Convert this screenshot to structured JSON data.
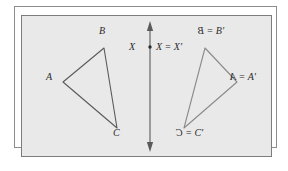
{
  "figure": {
    "background_color": "#ffffff",
    "panel_color": "#e9e9e9",
    "frame_border_color": "#8c8c8c",
    "panel_border_color": "#7d7d7d",
    "stroke_color": "#5a5a5a",
    "label_color": "#2b2b2b"
  },
  "mirror_line": {
    "name": "vertical-mirror-axis",
    "x": 150,
    "y_top": 22,
    "y_bottom": 151,
    "arrow_top": "up",
    "arrow_bottom": "down"
  },
  "center_point": {
    "label_left": "X",
    "label_right": "X = X'",
    "dot_x": 150,
    "dot_y": 47
  },
  "preimage": {
    "name": "triangle-ABC",
    "vertices": [
      {
        "label": "A",
        "x": 63,
        "y": 82
      },
      {
        "label": "B",
        "x": 104,
        "y": 48
      },
      {
        "label": "C",
        "x": 117,
        "y": 128
      }
    ],
    "labels": [
      {
        "text": "A",
        "x": 46,
        "y": 77
      },
      {
        "text": "B",
        "x": 99,
        "y": 31
      },
      {
        "text": "C",
        "x": 113,
        "y": 133
      }
    ]
  },
  "image": {
    "name": "triangle-A-prime-B-prime-C-prime",
    "vertices": [
      {
        "label": "A'",
        "x": 237,
        "y": 82
      },
      {
        "label": "B'",
        "x": 205,
        "y": 48
      },
      {
        "label": "C'",
        "x": 184,
        "y": 128
      }
    ],
    "labels": [
      {
        "mirrored": "B",
        "text": " = B'",
        "x": 198,
        "y": 31
      },
      {
        "mirrored": "A",
        "text": " = A'",
        "x": 230,
        "y": 77
      },
      {
        "mirrored": "C",
        "text": " = C'",
        "x": 176,
        "y": 133
      }
    ]
  }
}
